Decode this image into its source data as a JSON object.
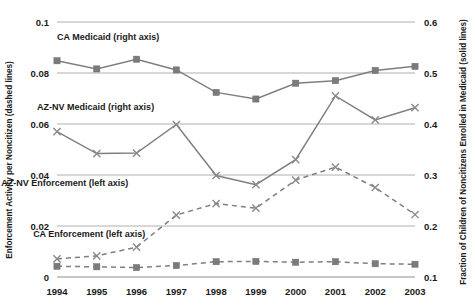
{
  "chart_data": {
    "type": "line",
    "title": "",
    "xlabel": "",
    "ylabel": "Enforcement Activity per Noncitizen (dashed lines)",
    "y2label": "Fraction of Children of Noncitizens Enrolled in Medicaid (solid lines)",
    "categories": [
      "1994",
      "1995",
      "1996",
      "1997",
      "1998",
      "1999",
      "2000",
      "2001",
      "2002",
      "2003"
    ],
    "ylim": [
      0,
      0.1
    ],
    "y2lim": [
      0.1,
      0.6
    ],
    "yticks": [
      "0",
      "0.02",
      "0.04",
      "0.06",
      "0.08",
      "0.1"
    ],
    "ytick_values": [
      0,
      0.02,
      0.04,
      0.06,
      0.08,
      0.1
    ],
    "y2ticks": [
      "0.1",
      "0.2",
      "0.3",
      "0.4",
      "0.5",
      "0.6"
    ],
    "y2tick_values": [
      0.1,
      0.2,
      0.3,
      0.4,
      0.5,
      0.6
    ],
    "grid": true,
    "legend_position": "inline-annotations",
    "series": [
      {
        "name": "CA Medicaid (right axis)",
        "axis": "right",
        "style": "solid",
        "marker": "square",
        "color": "#7f7f7f",
        "values": [
          0.524,
          0.508,
          0.527,
          0.506,
          0.462,
          0.449,
          0.48,
          0.485,
          0.505,
          0.513
        ],
        "label_x": 1994.0,
        "label_y": 0.093
      },
      {
        "name": "AZ-NV Medicaid (right axis)",
        "axis": "right",
        "style": "solid",
        "marker": "x",
        "color": "#8a8a8a",
        "values": [
          0.385,
          0.342,
          0.343,
          0.399,
          0.299,
          0.281,
          0.33,
          0.455,
          0.408,
          0.432
        ],
        "label_x": 1993.5,
        "label_y": 0.0655
      },
      {
        "name": "AZ-NV Enforcement  (left axis)",
        "axis": "left",
        "style": "dashed",
        "marker": "x",
        "color": "#8a8a8a",
        "values": [
          0.0071,
          0.0083,
          0.0117,
          0.0243,
          0.0288,
          0.027,
          0.038,
          0.0431,
          0.0351,
          0.0245
        ],
        "label_x": 1992.6,
        "label_y": 0.0355
      },
      {
        "name": "CA Enforcement (left axis)",
        "axis": "left",
        "style": "dashed",
        "marker": "square",
        "color": "#7b7b7b",
        "values": [
          0.0042,
          0.004,
          0.0037,
          0.0045,
          0.006,
          0.0061,
          0.0058,
          0.006,
          0.0052,
          0.005
        ],
        "label_x": 1993.4,
        "label_y": 0.0155
      }
    ]
  }
}
